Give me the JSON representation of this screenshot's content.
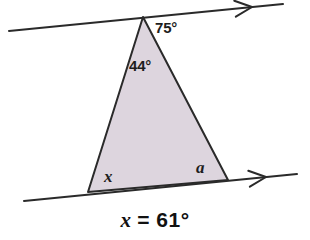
{
  "figure": {
    "background_color": "#ffffff",
    "stroke_color": "#2a2a2a",
    "triangle_fill": "#ddd5de",
    "triangle": {
      "apex": {
        "x": 143,
        "y": 17
      },
      "base_left": {
        "x": 88,
        "y": 192
      },
      "base_right": {
        "x": 228,
        "y": 180
      }
    },
    "top_line": {
      "name": "upper-parallel-line",
      "x1": 9,
      "y1": 31,
      "x2": 283,
      "y2": 4,
      "arrow_at_x": 252,
      "arrow_at_y": 7
    },
    "bottom_line": {
      "name": "lower-parallel-line",
      "x1": 24,
      "y1": 201,
      "x2": 297,
      "y2": 174,
      "arrow_at_x": 266,
      "arrow_at_y": 177
    },
    "labels": {
      "angle_top_right": "75°",
      "angle_apex_interior": "44°",
      "angle_base_left": "x",
      "angle_base_right": "a"
    },
    "caption": {
      "variable": "x",
      "rest": " = 61°",
      "full": "x = 61°"
    }
  }
}
